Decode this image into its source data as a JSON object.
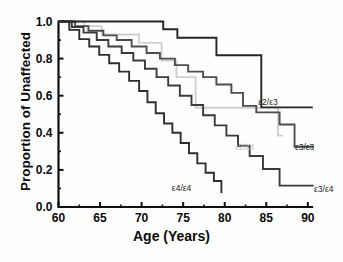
{
  "chart_data": {
    "type": "line",
    "title": "",
    "xlabel": "Age (Years)",
    "ylabel": "Proportion of Unaffected",
    "xlim": [
      60,
      90.5
    ],
    "ylim": [
      0.0,
      1.0
    ],
    "grid": false,
    "legend_position": "inline-annotations",
    "xticks": [
      60,
      65,
      70,
      75,
      80,
      85,
      90
    ],
    "xtick_labels": [
      "60",
      "65",
      "70",
      "75",
      "80",
      "85",
      "90"
    ],
    "yticks": [
      0.0,
      0.2,
      0.4,
      0.6,
      0.8,
      1.0
    ],
    "ytick_labels": [
      "0.0",
      "0.2",
      "0.4",
      "0.6",
      "0.8",
      "1.0"
    ],
    "step_type": "post",
    "series": [
      {
        "name": "ε2/ε3",
        "color": "#262626",
        "label_x": 83.8,
        "label_y": 0.565,
        "x": [
          60.0,
          71.3,
          72.6,
          74.2,
          74.3,
          78.6,
          79.0,
          84.2,
          84.4,
          90.6
        ],
        "y": [
          1.0,
          1.0,
          0.958,
          0.958,
          0.912,
          0.912,
          0.818,
          0.818,
          0.537,
          0.537
        ]
      },
      {
        "name": "ε2/ε4",
        "color": "#cfcfcf",
        "label_x": 81.0,
        "label_y": 0.325,
        "x": [
          60.0,
          62.3,
          63.1,
          65.0,
          65.2,
          69.5,
          69.7,
          72.2,
          72.4,
          74.0,
          74.2,
          76.3,
          76.5,
          86.2,
          86.4,
          87.0
        ],
        "y": [
          1.0,
          1.0,
          0.975,
          0.975,
          0.93,
          0.93,
          0.885,
          0.885,
          0.79,
          0.79,
          0.7,
          0.7,
          0.535,
          0.535,
          0.385,
          0.385
        ]
      },
      {
        "name": "ε3/ε3",
        "color": "#4d4d4d",
        "label_x": 88.2,
        "label_y": 0.325,
        "x": [
          60.0,
          61.6,
          62.0,
          63.2,
          63.6,
          65.0,
          65.4,
          66.6,
          67.0,
          68.4,
          68.8,
          70.2,
          70.6,
          71.8,
          72.2,
          73.6,
          74.0,
          75.2,
          75.6,
          77.0,
          77.4,
          78.6,
          79.0,
          80.4,
          80.8,
          81.8,
          82.2,
          83.4,
          83.8,
          86.2,
          86.6,
          88.0,
          88.4,
          90.7
        ],
        "y": [
          1.0,
          1.0,
          0.975,
          0.975,
          0.95,
          0.95,
          0.925,
          0.925,
          0.9,
          0.9,
          0.865,
          0.865,
          0.83,
          0.83,
          0.8,
          0.8,
          0.765,
          0.765,
          0.73,
          0.73,
          0.7,
          0.7,
          0.66,
          0.66,
          0.615,
          0.615,
          0.545,
          0.545,
          0.51,
          0.51,
          0.445,
          0.445,
          0.325,
          0.325
        ]
      },
      {
        "name": "ε3/ε4",
        "color": "#3a3a3a",
        "label_x": 90.5,
        "label_y": 0.095,
        "x": [
          60.0,
          61.2,
          61.6,
          62.6,
          63.0,
          64.2,
          64.6,
          65.6,
          66.0,
          67.2,
          67.6,
          68.6,
          69.0,
          70.0,
          70.4,
          71.4,
          71.8,
          72.8,
          73.2,
          74.2,
          74.6,
          75.6,
          76.0,
          77.0,
          77.4,
          78.4,
          78.8,
          79.8,
          80.2,
          81.2,
          81.6,
          82.6,
          83.0,
          84.2,
          84.6,
          86.2,
          86.6,
          90.7
        ],
        "y": [
          1.0,
          1.0,
          0.97,
          0.97,
          0.94,
          0.94,
          0.9,
          0.9,
          0.865,
          0.865,
          0.83,
          0.83,
          0.79,
          0.79,
          0.745,
          0.745,
          0.7,
          0.7,
          0.655,
          0.655,
          0.6,
          0.6,
          0.55,
          0.55,
          0.495,
          0.495,
          0.44,
          0.44,
          0.385,
          0.385,
          0.33,
          0.33,
          0.275,
          0.275,
          0.205,
          0.205,
          0.115,
          0.115
        ]
      },
      {
        "name": "ε4/ε4",
        "color": "#2e2e2e",
        "label_x": 73.4,
        "label_y": 0.1,
        "x": [
          60.0,
          61.0,
          61.3,
          62.2,
          62.5,
          63.4,
          63.7,
          64.6,
          64.9,
          65.8,
          66.1,
          67.0,
          67.3,
          68.2,
          68.5,
          69.4,
          69.7,
          70.4,
          70.7,
          71.4,
          71.7,
          72.4,
          72.7,
          73.4,
          73.7,
          74.4,
          74.7,
          75.4,
          75.7,
          76.4,
          76.7,
          77.4,
          77.7,
          78.4,
          78.7,
          79.4,
          79.6
        ],
        "y": [
          1.0,
          1.0,
          0.955,
          0.955,
          0.905,
          0.905,
          0.865,
          0.865,
          0.82,
          0.82,
          0.775,
          0.775,
          0.73,
          0.73,
          0.68,
          0.68,
          0.625,
          0.625,
          0.565,
          0.565,
          0.505,
          0.505,
          0.45,
          0.45,
          0.4,
          0.4,
          0.345,
          0.345,
          0.29,
          0.29,
          0.235,
          0.235,
          0.185,
          0.185,
          0.14,
          0.14,
          0.075
        ]
      }
    ],
    "axis": {
      "color": "#111111",
      "line_width": 2.2,
      "major_tick_len": 5,
      "minor_tick_len": 2.5
    }
  }
}
